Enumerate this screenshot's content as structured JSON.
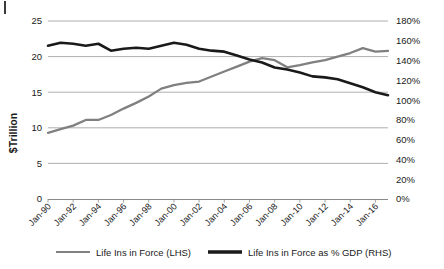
{
  "chart_data": {
    "type": "line",
    "title": "",
    "xlabel": "",
    "ylabel": "$Trillion",
    "y2label": "",
    "grid": true,
    "legend_position": "bottom",
    "x_tick_labels": [
      "Jan-90",
      "Jan-92",
      "Jan-94",
      "Jan-96",
      "Jan-98",
      "Jan-00",
      "Jan-02",
      "Jan-04",
      "Jan-06",
      "Jan-08",
      "Jan-10",
      "Jan-12",
      "Jan-14",
      "Jan-16"
    ],
    "ylim": [
      0,
      25
    ],
    "y_tick_labels": [
      "0",
      "5",
      "10",
      "15",
      "20",
      "25"
    ],
    "y_tick_values": [
      0,
      5,
      10,
      15,
      20,
      25
    ],
    "y2lim": [
      0,
      180
    ],
    "y2_tick_labels": [
      "0%",
      "20%",
      "40%",
      "60%",
      "80%",
      "100%",
      "120%",
      "140%",
      "160%",
      "180%"
    ],
    "y2_tick_values": [
      0,
      20,
      40,
      60,
      80,
      100,
      120,
      140,
      160,
      180
    ],
    "x": [
      1990,
      1991,
      1992,
      1993,
      1994,
      1995,
      1996,
      1997,
      1998,
      1999,
      2000,
      2001,
      2002,
      2003,
      2004,
      2005,
      2006,
      2007,
      2008,
      2009,
      2010,
      2011,
      2012,
      2013,
      2014,
      2015,
      2016,
      2017
    ],
    "series": [
      {
        "name": "Life Ins in Force (LHS)",
        "axis": "left",
        "color": "#808080",
        "values": [
          9.3,
          9.8,
          10.3,
          11.1,
          11.1,
          11.8,
          12.7,
          13.5,
          14.4,
          15.5,
          16.0,
          16.3,
          16.5,
          17.2,
          17.9,
          18.6,
          19.3,
          19.8,
          19.5,
          18.5,
          18.8,
          19.2,
          19.5,
          20.0,
          20.5,
          21.2,
          20.7,
          20.8
        ]
      },
      {
        "name": "Life Ins in Force as % GDP (RHS)",
        "axis": "right",
        "color": "#1a1a1a",
        "values": [
          155,
          158,
          157,
          155,
          157,
          150,
          152,
          153,
          152,
          155,
          158,
          156,
          152,
          150,
          149,
          145,
          141,
          138,
          133,
          131,
          128,
          124,
          123,
          121,
          117,
          113,
          108,
          105
        ]
      }
    ],
    "legend": [
      {
        "label": "Life Ins in Force (LHS)",
        "color": "#808080",
        "line_width": "thin"
      },
      {
        "label": "Life Ins in Force as % GDP (RHS)",
        "color": "#1a1a1a",
        "line_width": "thick"
      }
    ]
  }
}
